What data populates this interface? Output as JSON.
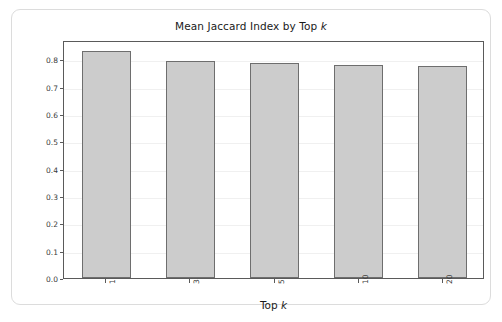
{
  "chart_data": {
    "type": "bar",
    "title": "Mean Jaccard Index by Top k",
    "title_plain": "Mean Jaccard Index by Top ",
    "title_italic": "k",
    "xlabel_plain": "Top ",
    "xlabel_italic": "k",
    "xlabel": "Top k",
    "ylabel": "Mean Jaccard Index",
    "categories": [
      "1",
      "3",
      "5",
      "10",
      "20"
    ],
    "values": [
      0.83,
      0.793,
      0.787,
      0.779,
      0.774
    ],
    "ylim": [
      0.0,
      0.87
    ],
    "yticks": [
      0.0,
      0.1,
      0.2,
      0.3,
      0.4,
      0.5,
      0.6,
      0.7,
      0.8
    ],
    "ytick_labels": [
      "0.0",
      "0.1",
      "0.2",
      "0.3",
      "0.4",
      "0.5",
      "0.6",
      "0.7",
      "0.8"
    ],
    "grid": true,
    "grid_axis": "y",
    "legend": null,
    "xtick_rotation": 90,
    "bar_color": "#cccccc",
    "bar_edge_color": "#6e6e6e",
    "background_color": "#ffffff",
    "frame_color": "#5a5a5a"
  }
}
